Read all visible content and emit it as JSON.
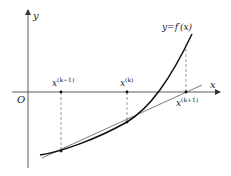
{
  "diagram": {
    "axes": {
      "x_label": "x",
      "y_label": "y",
      "origin_label": "O"
    },
    "curve": {
      "label": "y=f′(x)",
      "color": "#111111"
    },
    "points": [
      {
        "id": "x_km1",
        "base": "x",
        "sup": "(k−1)"
      },
      {
        "id": "x_k",
        "base": "x",
        "sup": "(k)"
      },
      {
        "id": "x_kp1",
        "base": "x",
        "sup": "(k+1)"
      }
    ],
    "tangent_line": {
      "color": "#444444",
      "description": "secant/tangent through curve points at x(k−1) and x(k) meeting x-axis at x(k+1)"
    },
    "guide_style": "dashed"
  }
}
